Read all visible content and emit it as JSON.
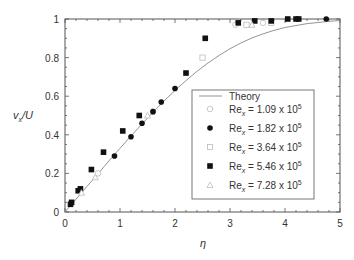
{
  "chart_data": {
    "type": "scatter",
    "title": "",
    "xlabel": "η",
    "ylabel_main": "v",
    "ylabel_sub": "x",
    "ylabel_tail": "/U",
    "xlim": [
      0,
      5
    ],
    "ylim": [
      0,
      1
    ],
    "xticks": [
      "0",
      "1",
      "2",
      "3",
      "4",
      "5"
    ],
    "yticks": [
      "0",
      "0.2",
      "0.4",
      "0.6",
      "0.8",
      "1"
    ],
    "grid": false,
    "legend_position": "center-right",
    "theory": {
      "name": "Theory",
      "x": [
        0,
        0.2,
        0.4,
        0.6,
        0.8,
        1.0,
        1.2,
        1.4,
        1.6,
        1.8,
        2.0,
        2.2,
        2.4,
        2.6,
        2.8,
        3.0,
        3.2,
        3.4,
        3.6,
        3.8,
        4.0,
        4.4,
        4.8,
        5.0
      ],
      "y": [
        0,
        0.066,
        0.133,
        0.198,
        0.265,
        0.33,
        0.394,
        0.456,
        0.517,
        0.575,
        0.63,
        0.681,
        0.729,
        0.772,
        0.811,
        0.846,
        0.876,
        0.902,
        0.923,
        0.941,
        0.956,
        0.976,
        0.988,
        0.992
      ]
    },
    "series": [
      {
        "name": "Re_x = 1.09 x 10^5",
        "label_main": "Re",
        "label_sub": "x",
        "label_tail": " = 1.09 x 10",
        "label_sup": "5",
        "marker": "open-circle",
        "x": [
          0.6,
          1.6,
          3.1,
          3.6
        ],
        "y": [
          0.2,
          0.52,
          0.97,
          0.98
        ]
      },
      {
        "name": "Re_x = 1.82 x 10^5",
        "label_main": "Re",
        "label_sub": "x",
        "label_tail": " = 1.82 x 10",
        "label_sup": "5",
        "marker": "filled-circle",
        "x": [
          0.9,
          1.2,
          1.4,
          1.6,
          1.75,
          2.0,
          4.75
        ],
        "y": [
          0.29,
          0.39,
          0.46,
          0.52,
          0.57,
          0.64,
          1.0
        ]
      },
      {
        "name": "Re_x = 3.64 x 10^5",
        "label_main": "Re",
        "label_sub": "x",
        "label_tail": " = 3.64 x 10",
        "label_sup": "5",
        "marker": "open-square",
        "x": [
          2.5,
          3.3,
          3.75
        ],
        "y": [
          0.8,
          0.97,
          0.98
        ]
      },
      {
        "name": "Re_x = 5.46 x 10^5",
        "label_main": "Re",
        "label_sub": "x",
        "label_tail": " = 5.46 x 10",
        "label_sup": "5",
        "marker": "filled-square",
        "x": [
          0.1,
          0.12,
          0.24,
          0.28,
          0.48,
          0.7,
          1.05,
          1.35,
          2.2,
          2.55,
          3.15,
          3.45,
          3.75,
          4.05,
          4.2,
          4.25
        ],
        "y": [
          0.04,
          0.05,
          0.11,
          0.12,
          0.22,
          0.31,
          0.42,
          0.5,
          0.72,
          0.9,
          0.98,
          0.99,
          0.99,
          1.0,
          1.0,
          1.0
        ]
      },
      {
        "name": "Re_x = 7.28 x 10^5",
        "label_main": "Re",
        "label_sub": "x",
        "label_tail": " = 7.28 x 10",
        "label_sup": "5",
        "marker": "open-triangle",
        "x": [
          0.3,
          0.55,
          1.5,
          3.4
        ],
        "y": [
          0.1,
          0.18,
          0.5,
          0.97
        ]
      }
    ]
  }
}
